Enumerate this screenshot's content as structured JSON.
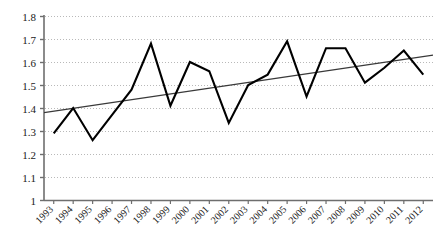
{
  "chart_data": {
    "type": "line",
    "title": "",
    "subtitle": "",
    "xlabel": "",
    "ylabel": "",
    "ylim": [
      1.0,
      1.8
    ],
    "ytick_labels": [
      "1",
      "1.1",
      "1.2",
      "1.3",
      "1.4",
      "1.5",
      "1.6",
      "1.7",
      "1.8"
    ],
    "ytick_values": [
      1.0,
      1.1,
      1.2,
      1.3,
      1.4,
      1.5,
      1.6,
      1.7,
      1.8
    ],
    "grid": "horizontal-dotted",
    "legend": "none",
    "categories": [
      "1993",
      "1994",
      "1995",
      "1996",
      "1997",
      "1998",
      "1999",
      "2000",
      "2001",
      "2002",
      "2003",
      "2004",
      "2005",
      "2006",
      "2007",
      "2008",
      "2009",
      "2010",
      "2011",
      "2012"
    ],
    "series": [
      {
        "name": "data",
        "color": "#000000",
        "values": [
          1.29,
          1.4,
          1.26,
          1.37,
          1.48,
          1.68,
          1.41,
          1.6,
          1.56,
          1.335,
          1.5,
          1.545,
          1.69,
          1.45,
          1.66,
          1.66,
          1.51,
          1.575,
          1.65,
          1.545
        ]
      },
      {
        "name": "trendline",
        "type": "linear-trend",
        "color": "#3a3a3a",
        "start_value": 1.38,
        "end_value": 1.63
      }
    ]
  },
  "axis": {
    "y_axis_name": "y-axis",
    "x_axis_name": "x-axis"
  }
}
